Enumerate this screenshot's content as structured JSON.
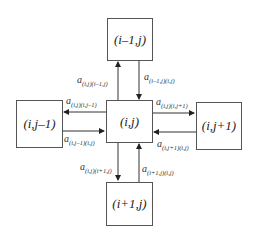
{
  "diagram": {
    "nodes": {
      "top": "(i–1,j)",
      "left": "(i,j–1)",
      "center": "(i,j)",
      "right": "(i,j+1)",
      "bottom": "(i+1,j)"
    },
    "edges": {
      "center_to_top": {
        "base": "a",
        "sub": "(i,j)(i–1,j)"
      },
      "top_to_center": {
        "base": "a",
        "sub": "(i–1,j)(i,j)"
      },
      "center_to_left": {
        "base": "a",
        "sub": "(i,j)(i,j–1)"
      },
      "left_to_center": {
        "base": "a",
        "sub": "(i,j–1)(i,j)"
      },
      "center_to_right": {
        "base": "a",
        "sub": "(i,j)(i,j+1)"
      },
      "right_to_center": {
        "base": "a",
        "sub": "(i,j+1)(i,j)"
      },
      "center_to_bottom": {
        "base": "a",
        "sub": "(i,j)(i+1,j)"
      },
      "bottom_to_center": {
        "base": "a",
        "sub": "(i+1,j)(i,j)"
      }
    }
  }
}
